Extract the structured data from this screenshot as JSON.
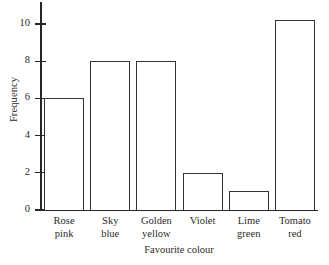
{
  "chart_data": {
    "type": "bar",
    "title": "",
    "xlabel": "Favourite colour",
    "ylabel": "Frequency",
    "categories": [
      "Rose pink",
      "Sky blue",
      "Golden yellow",
      "Violet",
      "Lime green",
      "Tomato red"
    ],
    "category_lines": [
      [
        "Rose",
        "pink"
      ],
      [
        "Sky",
        "blue"
      ],
      [
        "Golden",
        "yellow"
      ],
      [
        "Violet",
        ""
      ],
      [
        "Lime",
        "green"
      ],
      [
        "Tomato",
        "red"
      ]
    ],
    "values": [
      6,
      8,
      8,
      2,
      1,
      10.2
    ],
    "ylim": [
      0,
      10.2
    ],
    "yticks": [
      0,
      2,
      4,
      6,
      8,
      10
    ],
    "ytick_labels": [
      "0",
      "2",
      "4",
      "6",
      "8",
      "10"
    ],
    "grid": false,
    "legend": false,
    "bar_fill": "#ffffff",
    "bar_edge": "#333333",
    "axis_color": "#262626"
  }
}
